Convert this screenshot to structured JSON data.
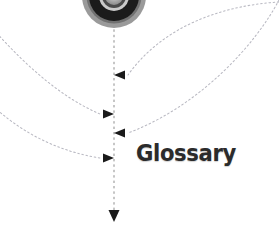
{
  "canvas": {
    "width": 279,
    "height": 234,
    "background": "#ffffff"
  },
  "labels": {
    "glossary": "Glossary"
  },
  "colors": {
    "text": "#2b2b2b",
    "dotted_line": "#b9b9c2",
    "axis_line": "#8d8d8d",
    "arrow": "#1a1a1a",
    "disc_outer_ring": "#9a9a9a",
    "disc_mid_ring": "#1b1b1b",
    "disc_inner_ring": "#c9c9c9",
    "disc_core": "#8e8e8e",
    "disc_highlight": "#e3e3e3"
  },
  "spine": {
    "x": 114,
    "top_y": 30,
    "bottom_y": 222,
    "style": "dashed",
    "end_marker": "arrow-down"
  },
  "disc": {
    "center_x": 114,
    "center_y": -4,
    "outer_radius": 32,
    "rings": [
      32,
      26,
      20,
      14,
      9
    ]
  },
  "connectors": [
    {
      "name": "connector-1",
      "direction": "left",
      "arrow_y": 75,
      "origin": "upper-right",
      "path": "M 279 2 C 215 6, 160 30, 128 75"
    },
    {
      "name": "connector-2",
      "direction": "right",
      "arrow_y": 114,
      "origin": "left",
      "path": "M -6 30 C 26 66, 62 98, 100 114"
    },
    {
      "name": "connector-3",
      "direction": "left",
      "arrow_y": 133,
      "origin": "upper-right",
      "path": "M 279 0 C 256 44, 200 106, 128 133"
    },
    {
      "name": "connector-4",
      "direction": "right",
      "arrow_y": 158,
      "origin": "lower-left",
      "path": "M -6 107 C 26 136, 62 152, 100 158"
    }
  ]
}
